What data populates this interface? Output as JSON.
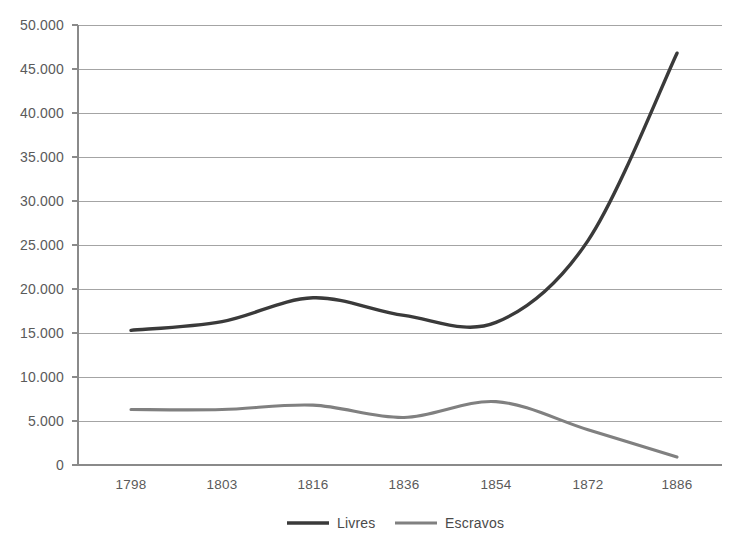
{
  "chart_data": {
    "type": "line",
    "title": "",
    "xlabel": "",
    "ylabel": "",
    "x": [
      1798,
      1803,
      1816,
      1836,
      1854,
      1872,
      1886
    ],
    "categories": [
      "1798",
      "1803",
      "1816",
      "1836",
      "1854",
      "1872",
      "1886"
    ],
    "series": [
      {
        "name": "Livres",
        "color": "#3a3a3a",
        "values": [
          15300,
          16300,
          19000,
          17000,
          16200,
          25500,
          46800
        ]
      },
      {
        "name": "Escravos",
        "color": "#808080",
        "values": [
          6300,
          6300,
          6800,
          5400,
          7200,
          4000,
          900
        ]
      }
    ],
    "ylim": [
      0,
      50000
    ],
    "ytick_values": [
      0,
      5000,
      10000,
      15000,
      20000,
      25000,
      30000,
      35000,
      40000,
      45000,
      50000
    ],
    "ytick_labels": [
      "0",
      "5.000",
      "10.000",
      "15.000",
      "20.000",
      "25.000",
      "30.000",
      "35.000",
      "40.000",
      "45.000",
      "50.000"
    ],
    "grid": true,
    "legend_position": "bottom",
    "smoothing": "spline"
  },
  "legend": {
    "items": [
      {
        "label": "Livres",
        "color": "#3a3a3a"
      },
      {
        "label": "Escravos",
        "color": "#808080"
      }
    ]
  },
  "axes": {
    "y_labels": [
      "50.000",
      "45.000",
      "40.000",
      "35.000",
      "30.000",
      "25.000",
      "20.000",
      "15.000",
      "10.000",
      "5.000",
      "0"
    ],
    "x_labels": [
      "1798",
      "1803",
      "1816",
      "1836",
      "1854",
      "1872",
      "1886"
    ]
  },
  "colors": {
    "livres": "#3a3a3a",
    "escravos": "#808080",
    "grid": "#9a9a9a",
    "axis": "#8a8a8a",
    "text": "#5a5a5a",
    "background": "#ffffff"
  }
}
